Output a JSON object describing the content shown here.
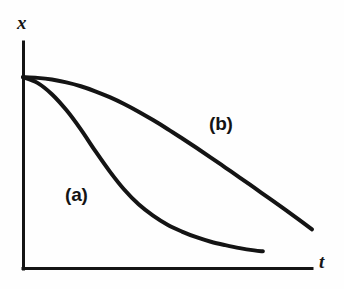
{
  "figure": {
    "background_color": "#fefefe",
    "ink_color": "#141414"
  },
  "chart_data": {
    "type": "line",
    "title": "",
    "subtitle": "",
    "xlabel": "t",
    "ylabel": "x",
    "grid": false,
    "legend_position": "inline-annotation",
    "axes": {
      "x_axis": {
        "label": "t",
        "tick_labels": [],
        "arrow": false,
        "origin_px": [
          23,
          269
        ],
        "end_px": [
          312,
          269
        ]
      },
      "y_axis": {
        "label": "x",
        "tick_labels": [],
        "arrow": false,
        "origin_px": [
          23,
          269
        ],
        "end_px": [
          23,
          42
        ]
      },
      "xlim": [
        0,
        1
      ],
      "ylim": [
        0,
        1
      ]
    },
    "annotations": [
      {
        "text": "(a)",
        "x": 0.16,
        "y": 0.32
      },
      {
        "text": "(b)",
        "x": 0.66,
        "y": 0.62
      }
    ],
    "series": [
      {
        "name": "(a)",
        "label": "(a)",
        "description": "fast monotonic decay, concave then convex, levels off near low plateau",
        "color": "#141414",
        "line_width": 4,
        "x": [
          0.0,
          0.05,
          0.1,
          0.15,
          0.2,
          0.25,
          0.3,
          0.35,
          0.4,
          0.45,
          0.5,
          0.55,
          0.6,
          0.65,
          0.7,
          0.75,
          0.8,
          0.83
        ],
        "y": [
          0.845,
          0.82,
          0.77,
          0.7,
          0.615,
          0.52,
          0.43,
          0.35,
          0.285,
          0.235,
          0.195,
          0.165,
          0.14,
          0.12,
          0.105,
          0.092,
          0.082,
          0.078
        ]
      },
      {
        "name": "(b)",
        "label": "(b)",
        "description": "slow sigmoidal decay, flat start then steady near-linear descent",
        "color": "#141414",
        "line_width": 4,
        "x": [
          0.0,
          0.05,
          0.1,
          0.15,
          0.2,
          0.25,
          0.3,
          0.35,
          0.4,
          0.45,
          0.5,
          0.55,
          0.6,
          0.65,
          0.7,
          0.75,
          0.8,
          0.85,
          0.9,
          0.95,
          1.0
        ],
        "y": [
          0.845,
          0.842,
          0.835,
          0.822,
          0.805,
          0.783,
          0.757,
          0.727,
          0.693,
          0.656,
          0.617,
          0.576,
          0.534,
          0.491,
          0.447,
          0.403,
          0.358,
          0.313,
          0.268,
          0.222,
          0.175
        ]
      }
    ]
  }
}
